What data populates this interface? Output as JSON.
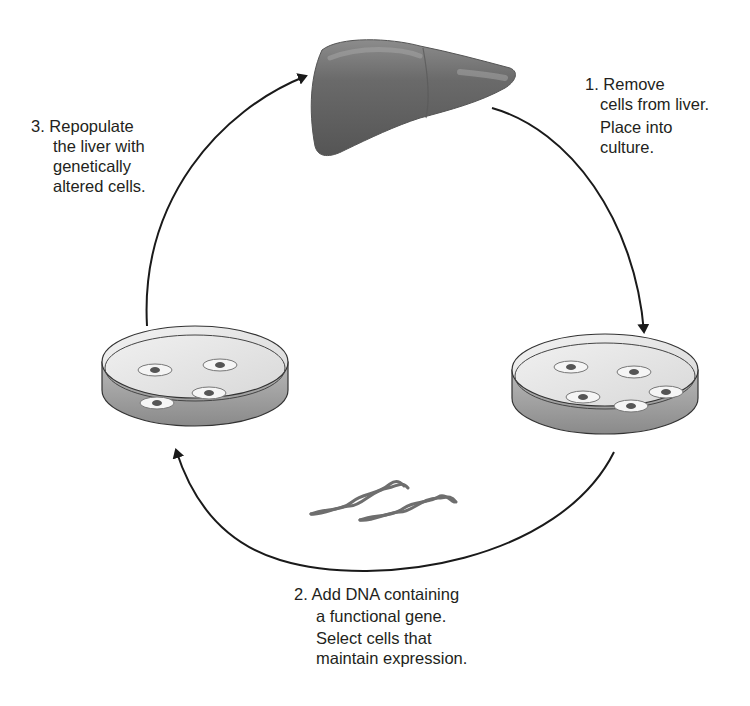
{
  "diagram": {
    "nodes": [
      {
        "id": "liver",
        "label": "Liver",
        "icon": "liver-icon"
      },
      {
        "id": "dish-right",
        "label": "Culture dish with cells (5 cells)",
        "icon": "petri-dish-icon",
        "cell_count": 5
      },
      {
        "id": "dish-left",
        "label": "Culture dish with genetically altered cells (4 cells)",
        "icon": "petri-dish-icon",
        "cell_count": 4
      },
      {
        "id": "dna",
        "label": "DNA strands",
        "icon": "dna-icon",
        "count": 2
      }
    ],
    "edges": [
      {
        "from": "liver",
        "to": "dish-right",
        "step": 1
      },
      {
        "from": "dish-right",
        "to": "dish-left",
        "step": 2
      },
      {
        "from": "dish-left",
        "to": "liver",
        "step": 3
      }
    ]
  },
  "steps": {
    "step1": {
      "number": "1.",
      "lines": [
        "Remove",
        "cells from liver.",
        "Place into",
        "culture."
      ]
    },
    "step2": {
      "number": "2.",
      "lines": [
        "Add DNA containing",
        "a functional gene.",
        "Select cells that",
        "maintain expression."
      ]
    },
    "step3": {
      "number": "3.",
      "lines": [
        "Repopulate",
        "the liver with",
        "genetically",
        "altered cells."
      ]
    }
  },
  "colors": {
    "arrow": "#1a1a1a",
    "liver": "#6b6b6b",
    "dish_fill": "#e6e6e6",
    "dish_side": "#9a9a9a",
    "cell_nucleus": "#555555",
    "dna": "#6e6e6e",
    "text": "#231f20"
  }
}
